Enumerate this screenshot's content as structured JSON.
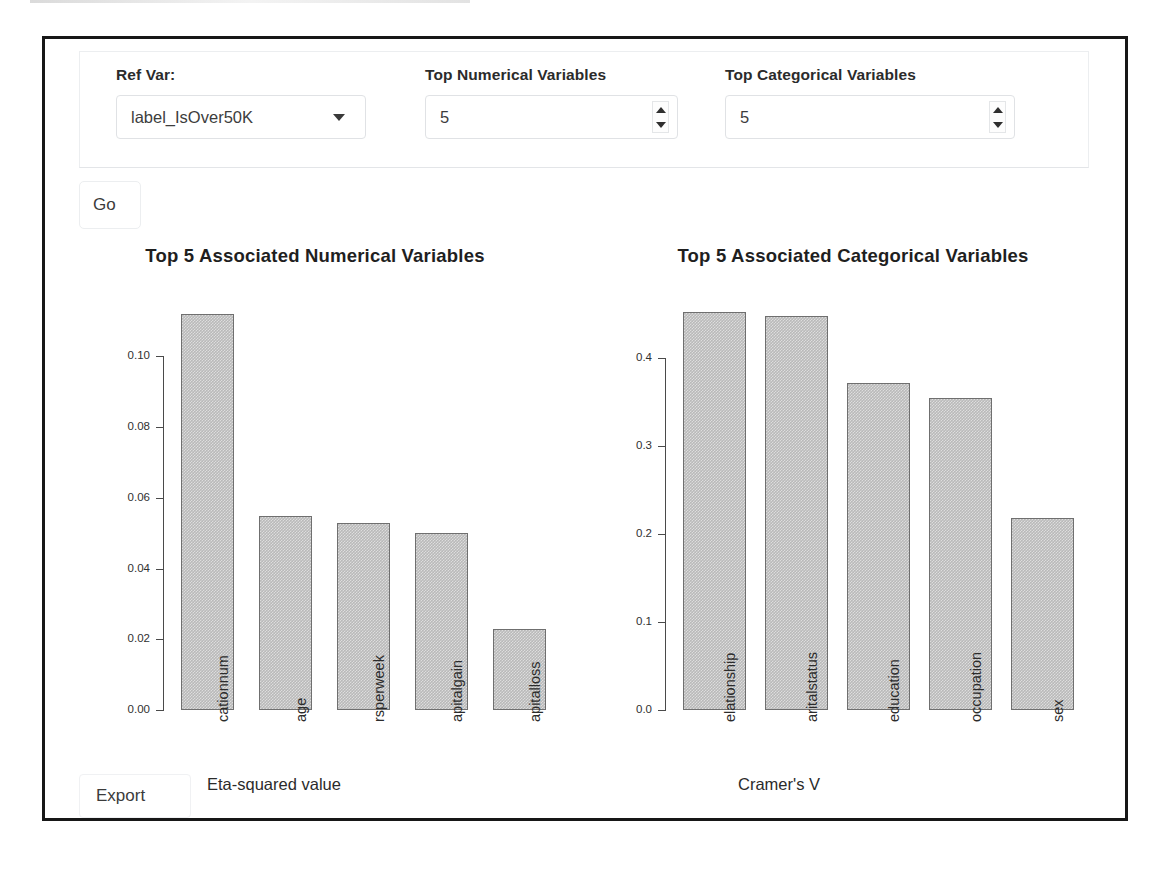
{
  "controls": {
    "ref_var": {
      "label": "Ref Var:",
      "value": "label_IsOver50K",
      "caret_icon": "chevron-down-icon"
    },
    "top_numerical": {
      "label": "Top Numerical Variables",
      "value": "5"
    },
    "top_categorical": {
      "label": "Top Categorical Variables",
      "value": "5"
    },
    "go_label": "Go",
    "export_label": "Export"
  },
  "chart_data": [
    {
      "type": "bar",
      "title": "Top 5 Associated Numerical Variables",
      "categories": [
        "cationnum",
        "age",
        "rsperweek",
        "apitalgain",
        "apitalloss"
      ],
      "values": [
        0.112,
        0.055,
        0.053,
        0.05,
        0.023
      ],
      "xlabel": "Eta-squared value",
      "ylabel": "",
      "ylim": [
        0.0,
        0.1185
      ],
      "yticks": [
        "0.00",
        "0.02",
        "0.04",
        "0.06",
        "0.08",
        "0.10"
      ],
      "ytick_values": [
        0.0,
        0.02,
        0.04,
        0.06,
        0.08,
        0.1
      ],
      "grid": false,
      "legend": "none",
      "bar_color": "#b9b9b9",
      "bar_border_color": "#6f6f6f"
    },
    {
      "type": "bar",
      "title": "Top 5 Associated Categorical Variables",
      "categories": [
        "elationship",
        "aritalstatus",
        "education",
        "occupation",
        "sex"
      ],
      "values": [
        0.452,
        0.447,
        0.371,
        0.354,
        0.218
      ],
      "xlabel": "Cramer's V",
      "ylabel": "",
      "ylim": [
        0.0,
        0.4755
      ],
      "yticks": [
        "0.0",
        "0.1",
        "0.2",
        "0.3",
        "0.4"
      ],
      "ytick_values": [
        0.0,
        0.1,
        0.2,
        0.3,
        0.4
      ],
      "grid": false,
      "legend": "none",
      "bar_color": "#b9b9b9",
      "bar_border_color": "#6f6f6f"
    }
  ]
}
